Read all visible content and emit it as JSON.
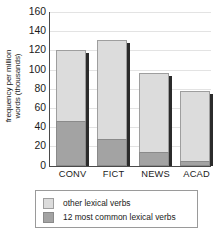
{
  "chart_data": {
    "type": "bar",
    "stacked": true,
    "title": "",
    "xlabel": "",
    "ylabel": "frequency per million words (thousands)",
    "ylabel_lines": [
      "frequency per million",
      "words (thousands)"
    ],
    "categories": [
      "CONV",
      "FICT",
      "NEWS",
      "ACAD"
    ],
    "ylim": [
      0,
      160
    ],
    "yticks": [
      160,
      140,
      120,
      100,
      80,
      60,
      40,
      20,
      0
    ],
    "ytick_labels": [
      "160",
      "140",
      "120",
      "100",
      "80",
      "60",
      "40",
      "20",
      "0"
    ],
    "grid": true,
    "legend_position": "bottom",
    "series": [
      {
        "name": "12 most common lexical verbs",
        "color": "#a3a3a3",
        "values": [
          47,
          28,
          14,
          5
        ]
      },
      {
        "name": "other lexical verbs",
        "color": "#dcdcdc",
        "values": [
          73,
          103,
          83,
          73
        ]
      }
    ],
    "totals": [
      120,
      131,
      97,
      78
    ],
    "legend": [
      {
        "label": "other lexical verbs",
        "color": "#dcdcdc"
      },
      {
        "label": "12 most common lexical verbs",
        "color": "#a3a3a3"
      }
    ]
  }
}
